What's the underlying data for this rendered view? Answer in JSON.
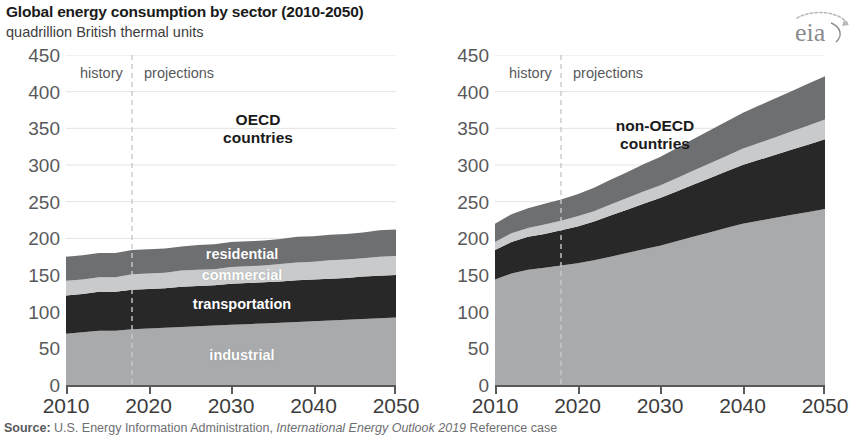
{
  "header": {
    "title": "Global energy consumption by sector (2010-2050)",
    "subtitle": "quadrillion British thermal units",
    "logo_text": "eia"
  },
  "footer": {
    "source_prefix": "Source:",
    "source_body": " U.S. Energy Information Administration, ",
    "source_italic": "International Energy Outlook 2019",
    "source_suffix": " Reference case"
  },
  "annotations": {
    "history": "history",
    "projections": "projections",
    "divider_year": 2018
  },
  "colors": {
    "industrial": "#a9aaac",
    "transportation": "#282829",
    "commercial": "#c9cacb",
    "residential": "#6e6f71",
    "axis": "#58595b",
    "grid": "#e3e3e3",
    "divider": "#c8c9ca",
    "label_text": "#ffffff"
  },
  "chart_data": [
    {
      "type": "area",
      "title": "OECD\ncountries",
      "title_line1": "OECD",
      "title_line2": "countries",
      "xlabel": "",
      "ylabel": "quadrillion British thermal units",
      "xlim": [
        2010,
        2050
      ],
      "ylim": [
        0,
        450
      ],
      "yticks": [
        0,
        50,
        100,
        150,
        200,
        250,
        300,
        350,
        400,
        450
      ],
      "xticks": [
        2010,
        2020,
        2030,
        2040,
        2050
      ],
      "grid": true,
      "stacked": true,
      "legend": "in-plot labels",
      "x": [
        2010,
        2012,
        2014,
        2016,
        2018,
        2020,
        2022,
        2024,
        2026,
        2028,
        2030,
        2032,
        2034,
        2036,
        2038,
        2040,
        2042,
        2044,
        2046,
        2048,
        2050
      ],
      "series": [
        {
          "name": "industrial",
          "label": "industrial",
          "color": "#a9aaac",
          "values": [
            70,
            72,
            74,
            74,
            76,
            77,
            78,
            79,
            80,
            81,
            82,
            83,
            84,
            85,
            86,
            87,
            88,
            89,
            90,
            91,
            92
          ]
        },
        {
          "name": "transportation",
          "label": "transportation",
          "color": "#282829",
          "values": [
            52,
            52,
            53,
            53,
            54,
            54,
            54,
            55,
            55,
            55,
            56,
            56,
            56,
            56,
            57,
            57,
            57,
            57,
            58,
            58,
            58
          ]
        },
        {
          "name": "commercial",
          "label": "commercial",
          "color": "#c9cacb",
          "values": [
            20,
            20,
            20,
            20,
            21,
            21,
            21,
            22,
            22,
            22,
            23,
            23,
            23,
            24,
            24,
            24,
            25,
            25,
            25,
            26,
            26
          ]
        },
        {
          "name": "residential",
          "label": "residential",
          "color": "#6e6f71",
          "values": [
            33,
            33,
            33,
            33,
            33,
            33,
            33,
            33,
            34,
            34,
            34,
            34,
            34,
            34,
            35,
            35,
            35,
            35,
            35,
            36,
            36
          ]
        }
      ],
      "totals": [
        175,
        177,
        180,
        180,
        184,
        185,
        186,
        189,
        191,
        192,
        195,
        196,
        197,
        199,
        202,
        203,
        205,
        206,
        208,
        211,
        212
      ]
    },
    {
      "type": "area",
      "title": "non-OECD\ncountries",
      "title_line1": "non-OECD",
      "title_line2": "countries",
      "xlabel": "",
      "ylabel": "quadrillion British thermal units",
      "xlim": [
        2010,
        2050
      ],
      "ylim": [
        0,
        450
      ],
      "yticks": [
        0,
        50,
        100,
        150,
        200,
        250,
        300,
        350,
        400,
        450
      ],
      "xticks": [
        2010,
        2020,
        2030,
        2040,
        2050
      ],
      "grid": true,
      "stacked": true,
      "legend": "none",
      "x": [
        2010,
        2012,
        2014,
        2016,
        2018,
        2020,
        2022,
        2024,
        2026,
        2028,
        2030,
        2032,
        2034,
        2036,
        2038,
        2040,
        2042,
        2044,
        2046,
        2048,
        2050
      ],
      "series": [
        {
          "name": "industrial",
          "label": "industrial",
          "color": "#a9aaac",
          "values": [
            144,
            152,
            157,
            160,
            163,
            166,
            170,
            175,
            180,
            185,
            190,
            196,
            202,
            208,
            214,
            220,
            224,
            228,
            232,
            236,
            240
          ]
        },
        {
          "name": "transportation",
          "label": "transportation",
          "color": "#282829",
          "values": [
            40,
            43,
            45,
            46,
            48,
            50,
            53,
            56,
            59,
            62,
            65,
            68,
            71,
            74,
            77,
            80,
            83,
            86,
            89,
            92,
            95
          ]
        },
        {
          "name": "commercial",
          "label": "commercial",
          "color": "#c9cacb",
          "values": [
            11,
            12,
            12,
            13,
            13,
            14,
            14,
            15,
            16,
            17,
            17,
            18,
            19,
            20,
            21,
            22,
            23,
            24,
            25,
            26,
            27
          ]
        },
        {
          "name": "residential",
          "label": "residential",
          "color": "#6e6f71",
          "values": [
            25,
            26,
            27,
            28,
            29,
            30,
            32,
            34,
            35,
            37,
            39,
            41,
            43,
            45,
            47,
            49,
            51,
            53,
            55,
            57,
            59
          ]
        }
      ],
      "totals": [
        220,
        233,
        241,
        247,
        253,
        260,
        269,
        280,
        290,
        301,
        311,
        323,
        335,
        347,
        359,
        371,
        381,
        391,
        401,
        411,
        421
      ]
    }
  ]
}
